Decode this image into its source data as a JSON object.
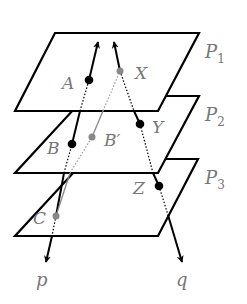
{
  "diagram": {
    "planes": [
      {
        "label": "P",
        "subscript": "1"
      },
      {
        "label": "P",
        "subscript": "2"
      },
      {
        "label": "P",
        "subscript": "3"
      }
    ],
    "points": {
      "A": "A",
      "X": "X",
      "B": "B",
      "B_prime": "B′",
      "Y": "Y",
      "C": "C",
      "Z": "Z"
    },
    "rays": {
      "p": "p",
      "q": "q"
    },
    "colors": {
      "line": "#000000",
      "label": "#777777",
      "gray_point": "#888888"
    }
  }
}
